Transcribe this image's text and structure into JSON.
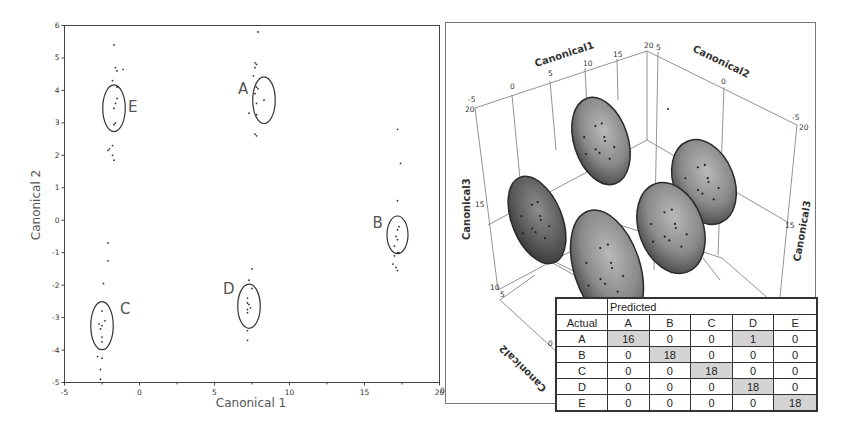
{
  "chart_data": [
    {
      "type": "scatter",
      "title": "",
      "xlabel": "Canonical 1",
      "ylabel": "Canonical 2",
      "xlim": [
        -5,
        20
      ],
      "ylim": [
        -5,
        6
      ],
      "x_ticks": [
        "-5",
        "0",
        "5",
        "10",
        "15",
        "20"
      ],
      "y_ticks": [
        "6",
        "5",
        "4",
        "3",
        "2",
        "1",
        "0",
        "-1",
        "-2",
        "-3",
        "-4",
        "-5"
      ],
      "grid": false,
      "legend": "none",
      "clusters": [
        {
          "label": "E",
          "center": [
            -1.7,
            3.45
          ],
          "ellipse_radii": [
            0.75,
            0.72
          ],
          "points": [
            [
              -1.7,
              5.4
            ],
            [
              -1.6,
              4.7
            ],
            [
              -1.1,
              4.65
            ],
            [
              -1.5,
              4.6
            ],
            [
              -1.8,
              4.3
            ],
            [
              -1.5,
              4.1
            ],
            [
              -1.5,
              3.75
            ],
            [
              -1.6,
              3.6
            ],
            [
              -1.7,
              3.45
            ],
            [
              -1.6,
              3.0
            ],
            [
              -1.7,
              2.95
            ],
            [
              -1.8,
              2.3
            ],
            [
              -2.0,
              2.2
            ],
            [
              -2.1,
              2.15
            ],
            [
              -1.8,
              2.0
            ],
            [
              -1.7,
              1.85
            ]
          ]
        },
        {
          "label": "A",
          "center": [
            8.3,
            3.7
          ],
          "ellipse_radii": [
            0.75,
            0.72
          ],
          "points": [
            [
              7.9,
              5.8
            ],
            [
              7.7,
              4.85
            ],
            [
              7.8,
              4.8
            ],
            [
              7.7,
              4.7
            ],
            [
              7.6,
              4.45
            ],
            [
              7.8,
              4.1
            ],
            [
              7.9,
              4.05
            ],
            [
              8.3,
              3.7
            ],
            [
              7.7,
              3.9
            ],
            [
              7.8,
              3.6
            ],
            [
              7.3,
              3.3
            ],
            [
              7.8,
              3.25
            ],
            [
              7.7,
              2.65
            ],
            [
              7.8,
              2.6
            ]
          ]
        },
        {
          "label": "B",
          "center": [
            17.2,
            -0.45
          ],
          "ellipse_radii": [
            0.7,
            0.58
          ],
          "points": [
            [
              17.2,
              2.8
            ],
            [
              17.4,
              1.75
            ],
            [
              17.2,
              0.6
            ],
            [
              17.3,
              -0.2
            ],
            [
              17.2,
              -0.3
            ],
            [
              17.1,
              -0.5
            ],
            [
              17.2,
              -0.6
            ],
            [
              17.0,
              -0.8
            ],
            [
              17.2,
              -1.0
            ],
            [
              17.0,
              -1.1
            ],
            [
              17.3,
              -1.0
            ],
            [
              16.9,
              -1.35
            ],
            [
              17.1,
              -1.45
            ],
            [
              17.2,
              -1.55
            ]
          ]
        },
        {
          "label": "D",
          "center": [
            7.3,
            -2.65
          ],
          "ellipse_radii": [
            0.75,
            0.68
          ],
          "points": [
            [
              7.5,
              -1.5
            ],
            [
              7.3,
              -1.85
            ],
            [
              7.5,
              -2.1
            ],
            [
              7.2,
              -2.4
            ],
            [
              7.2,
              -2.55
            ],
            [
              7.3,
              -2.6
            ],
            [
              7.4,
              -2.7
            ],
            [
              7.2,
              -2.75
            ],
            [
              7.2,
              -2.85
            ],
            [
              7.2,
              -3.4
            ],
            [
              7.2,
              -3.7
            ]
          ]
        },
        {
          "label": "C",
          "center": [
            -2.5,
            -3.25
          ],
          "ellipse_radii": [
            0.75,
            0.74
          ],
          "points": [
            [
              -2.1,
              -0.7
            ],
            [
              -2.1,
              -1.25
            ],
            [
              -2.4,
              -1.95
            ],
            [
              -2.5,
              -2.8
            ],
            [
              -2.3,
              -3.1
            ],
            [
              -2.5,
              -3.25
            ],
            [
              -2.7,
              -3.2
            ],
            [
              -2.6,
              -3.35
            ],
            [
              -2.5,
              -3.6
            ],
            [
              -2.5,
              -3.75
            ],
            [
              -2.8,
              -4.2
            ],
            [
              -2.5,
              -4.25
            ],
            [
              -2.6,
              -4.6
            ],
            [
              -2.6,
              -4.9
            ]
          ]
        }
      ]
    },
    {
      "type": "scatter3d",
      "title": "",
      "axes": {
        "x": {
          "label": "Canonical1",
          "ticks": [
            "-5",
            "0",
            "5",
            "10",
            "15",
            "20"
          ]
        },
        "y": {
          "label": "Canonical2",
          "ticks": [
            "5",
            "0",
            "-5"
          ]
        },
        "z": {
          "label": "Canonical3",
          "ticks": [
            "20",
            "15",
            "10"
          ]
        },
        "floor_ticks": [
          "10",
          "5",
          "0"
        ]
      },
      "ellipsoids": 5,
      "note": "Five shaded 95% ellipsoids with scattered points"
    },
    {
      "type": "table",
      "title": "Confusion matrix",
      "header_top": "Predicted",
      "row_header_label": "Actual",
      "columns": [
        "A",
        "B",
        "C",
        "D",
        "E"
      ],
      "rows": [
        {
          "actual": "A",
          "values": [
            16,
            0,
            0,
            1,
            0
          ]
        },
        {
          "actual": "B",
          "values": [
            0,
            18,
            0,
            0,
            0
          ]
        },
        {
          "actual": "C",
          "values": [
            0,
            0,
            18,
            0,
            0
          ]
        },
        {
          "actual": "D",
          "values": [
            0,
            0,
            0,
            18,
            0
          ]
        },
        {
          "actual": "E",
          "values": [
            0,
            0,
            0,
            0,
            18
          ]
        }
      ]
    }
  ],
  "left_plot": {
    "xlabel": "Canonical 1",
    "ylabel": "Canonical 2",
    "x_ticks": [
      {
        "v": -5,
        "label": "-5"
      },
      {
        "v": 0,
        "label": "0"
      },
      {
        "v": 5,
        "label": "5"
      },
      {
        "v": 10,
        "label": "10"
      },
      {
        "v": 15,
        "label": "15"
      },
      {
        "v": 20,
        "label": "20"
      }
    ],
    "y_ticks": [
      {
        "v": 6,
        "label": "6"
      },
      {
        "v": 5,
        "label": "5"
      },
      {
        "v": 4,
        "label": "4"
      },
      {
        "v": 3,
        "label": "3"
      },
      {
        "v": 2,
        "label": "2"
      },
      {
        "v": 1,
        "label": "1"
      },
      {
        "v": 0,
        "label": "0"
      },
      {
        "v": -1,
        "label": "-1"
      },
      {
        "v": -2,
        "label": "-2"
      },
      {
        "v": -3,
        "label": "-3"
      },
      {
        "v": -4,
        "label": "-4"
      },
      {
        "v": -5,
        "label": "-5"
      }
    ],
    "cluster_labels": [
      "E",
      "A",
      "B",
      "D",
      "C"
    ]
  },
  "plot3d": {
    "x_label": "Canonical1",
    "y_label": "Canonical2",
    "z_label_left": "Canonical3",
    "z_label_right": "Canonical3",
    "canonical2_floor_label": "Canonical2",
    "x_ticks": [
      "-5",
      "0",
      "5",
      "10",
      "15",
      "20"
    ],
    "y_ticks": [
      "5",
      "0",
      "-5"
    ],
    "z_ticks_left": [
      "20",
      "15",
      "10"
    ],
    "z_ticks_right": [
      "20",
      "15"
    ],
    "floor_ticks": [
      "5",
      "0"
    ],
    "bottom_tick": "0"
  },
  "table": {
    "predicted": "Predicted",
    "actual": "Actual",
    "columns": [
      "A",
      "B",
      "C",
      "D",
      "E"
    ],
    "rows": [
      {
        "actual": "A",
        "values": [
          "16",
          "0",
          "0",
          "1",
          "0"
        ]
      },
      {
        "actual": "B",
        "values": [
          "0",
          "18",
          "0",
          "0",
          "0"
        ]
      },
      {
        "actual": "C",
        "values": [
          "0",
          "0",
          "18",
          "0",
          "0"
        ]
      },
      {
        "actual": "D",
        "values": [
          "0",
          "0",
          "0",
          "18",
          "0"
        ]
      },
      {
        "actual": "E",
        "values": [
          "0",
          "0",
          "0",
          "0",
          "18"
        ]
      }
    ]
  },
  "colors": {
    "axis": "#444444",
    "point": "#333333",
    "ellipse_stroke": "#333333",
    "ellipsoid_fill": "#8a8a8a",
    "ellipsoid_dark": "#3a3a3a",
    "table_highlight": "#d4d4d4",
    "label_text": "#555555"
  }
}
